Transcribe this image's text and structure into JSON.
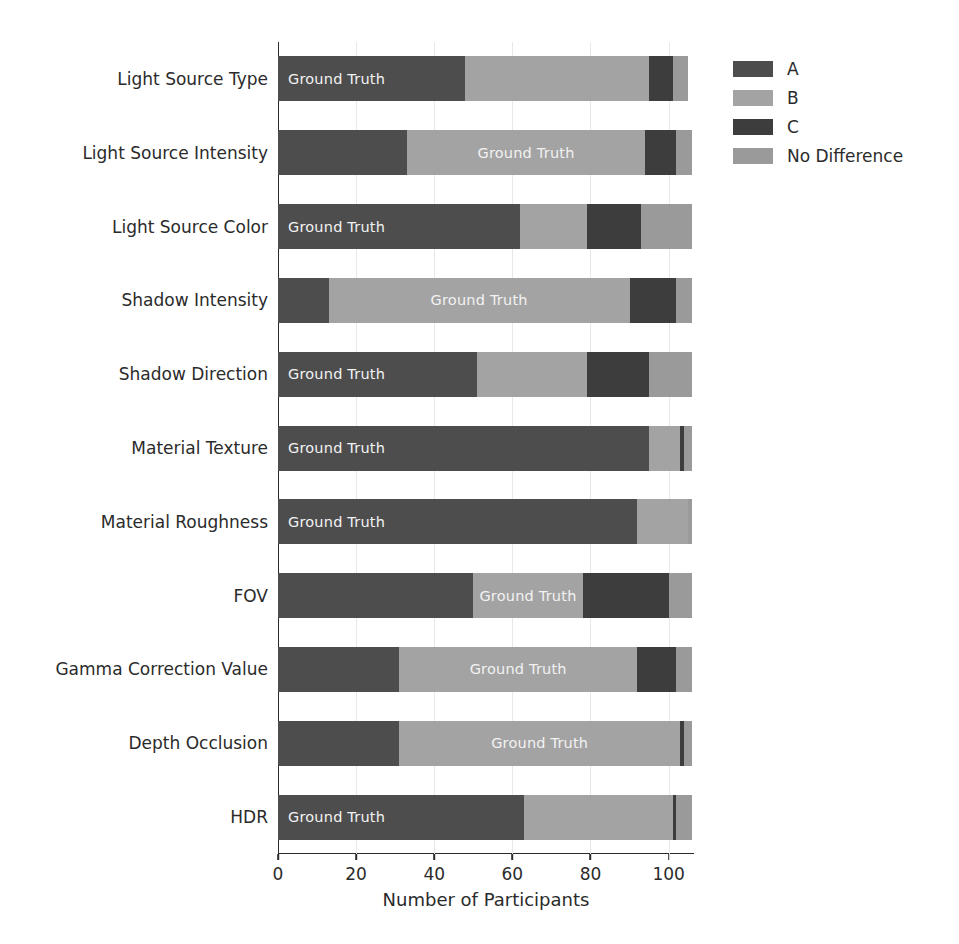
{
  "chart_data": {
    "type": "bar",
    "orientation": "horizontal",
    "stacked": true,
    "title": "",
    "xlabel": "Number of Participants",
    "ylabel": "",
    "xlim": [
      0,
      106.5
    ],
    "xticks": [
      0,
      20,
      40,
      60,
      80,
      100
    ],
    "xticklabels": [
      "0",
      "20",
      "40",
      "60",
      "80",
      "100"
    ],
    "grid": true,
    "grid_axis": "x",
    "legend_position": "upper right",
    "categories": [
      "Light Source Type",
      "Light Source Intensity",
      "Light Source Color",
      "Shadow Intensity",
      "Shadow Direction",
      "Material Texture",
      "Material Roughness",
      "FOV",
      "Gamma Correction Value",
      "Depth Occlusion",
      "HDR"
    ],
    "series": [
      {
        "name": "A",
        "color": "#4d4d4d",
        "values": [
          48,
          33,
          62,
          13,
          51,
          95,
          92,
          50,
          31,
          31,
          63
        ]
      },
      {
        "name": "B",
        "color": "#a3a3a3",
        "values": [
          47,
          61,
          17,
          77,
          28,
          8,
          13,
          28,
          61,
          72,
          38
        ]
      },
      {
        "name": "C",
        "color": "#3d3d3d",
        "values": [
          6,
          8,
          14,
          12,
          16,
          1,
          0,
          22,
          10,
          1,
          1
        ]
      },
      {
        "name": "No Difference",
        "color": "#9a9a9a",
        "values": [
          4,
          4,
          13,
          4,
          11,
          2,
          1,
          6,
          4,
          2,
          4
        ]
      }
    ],
    "ground_truth_label": "Ground Truth",
    "ground_truth_in_segment": [
      0,
      1,
      0,
      1,
      0,
      0,
      0,
      1,
      1,
      1,
      0
    ]
  },
  "legend": {
    "items": [
      {
        "label": "A",
        "color": "#4d4d4d"
      },
      {
        "label": "B",
        "color": "#a3a3a3"
      },
      {
        "label": "C",
        "color": "#3d3d3d"
      },
      {
        "label": "No Difference",
        "color": "#9a9a9a"
      }
    ]
  }
}
